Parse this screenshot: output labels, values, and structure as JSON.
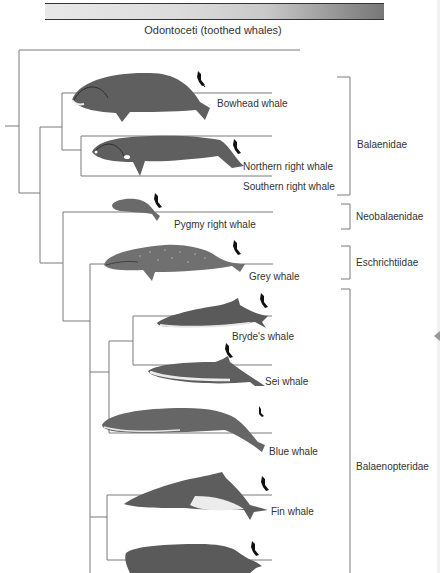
{
  "header": {
    "outgroup_label": "Odontoceti (toothed whales)"
  },
  "species": [
    {
      "name": "Bowhead whale"
    },
    {
      "name": "Northern right whale"
    },
    {
      "name": "Southern right whale"
    },
    {
      "name": "Pygmy right whale"
    },
    {
      "name": "Grey whale"
    },
    {
      "name": "Bryde's whale"
    },
    {
      "name": "Sei whale"
    },
    {
      "name": "Blue whale"
    },
    {
      "name": "Fin whale"
    }
  ],
  "families": [
    {
      "name": "Balaenidae"
    },
    {
      "name": "Neobalaenidae"
    },
    {
      "name": "Eschrichtiidae"
    },
    {
      "name": "Balaenopteridae"
    }
  ],
  "colors": {
    "line": "#7a7a7a",
    "whale_body": "#5f5f5f",
    "whale_belly": "#e9e9e9",
    "diver": "#111111"
  }
}
